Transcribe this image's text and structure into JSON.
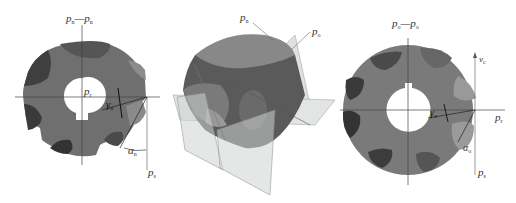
{
  "figure": {
    "panels": [
      {
        "id": "normal-view",
        "labels": {
          "top_plane": "p",
          "top_plane_sub": "n",
          "top_plane_b": "p",
          "top_plane_b_sub": "n",
          "reference_plane": "p",
          "reference_plane_sub": "r",
          "rake_angle": "γ",
          "rake_angle_sub": "n",
          "clearance_angle": "α",
          "clearance_angle_sub": "n",
          "cutting_plane": "p",
          "cutting_plane_sub": "s"
        }
      },
      {
        "id": "isometric-view",
        "labels": {
          "plane_1": "p",
          "plane_1_sub": "n",
          "plane_2": "p",
          "plane_2_sub": "o"
        }
      },
      {
        "id": "orthogonal-view",
        "labels": {
          "top_plane": "p",
          "top_plane_sub": "o",
          "top_plane_b": "p",
          "top_plane_b_sub": "o",
          "velocity_axis": "v",
          "velocity_axis_sub": "c",
          "reference_plane": "p",
          "reference_plane_sub": "r",
          "rake_angle": "γ",
          "rake_angle_sub": "o",
          "clearance_angle": "α",
          "clearance_angle_sub": "o",
          "cutting_plane": "p",
          "cutting_plane_sub": "s"
        }
      }
    ],
    "colors": {
      "body": "#6f6f6f",
      "body_dark": "#3f3f3f",
      "flute_light": "#9a9a9a",
      "plane_fill": "#d9dcdc",
      "line": "#444444"
    }
  }
}
